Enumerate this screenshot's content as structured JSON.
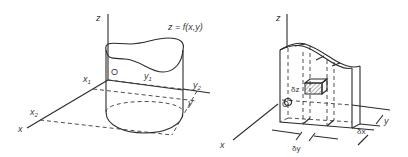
{
  "figure": {
    "left_panel": {
      "description": "Cylindrical region under surface z = f(x,y) above x-y plane",
      "labels": {
        "z_axis": "z",
        "x_axis": "x",
        "y_axis": "y",
        "origin": "O",
        "surface": "z = f(x,y)",
        "x1": "x",
        "x1_sub": "1",
        "x2": "x",
        "x2_sub": "2",
        "y1": "y",
        "y1_sub": "1",
        "y2": "y",
        "y2_sub": "2"
      }
    },
    "right_panel": {
      "description": "Slab of the volume subdivided into elemental boxes with hatched element",
      "labels": {
        "z_axis": "z",
        "x_axis": "x",
        "y_axis": "y",
        "origin": "O",
        "delta_z": "δz",
        "delta_y": "δy",
        "delta_x": "δx"
      }
    },
    "colors": {
      "line": "#2a2a2a",
      "text": "#3a3a3a",
      "background": "#ffffff"
    }
  }
}
